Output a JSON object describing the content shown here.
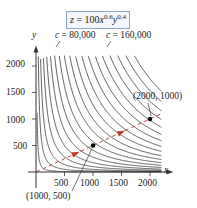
{
  "chart_data": {
    "type": "line",
    "formula": {
      "prefix": "z = 100",
      "x_exp": "0.6",
      "y_exp": "0.4"
    },
    "xlabel": "x",
    "ylabel": "y",
    "xlim": [
      0,
      2200
    ],
    "ylim": [
      0,
      2200
    ],
    "x_ticks": [
      "500",
      "1000",
      "1500",
      "2000"
    ],
    "y_ticks": [
      "500",
      "1000",
      "1500",
      "2000"
    ],
    "grid": false,
    "series": [
      {
        "name": "level curves",
        "description": "Level curves 100x^0.6 y^0.4 = c, c = 10,000 to 190,000 step 10,000",
        "c_values": [
          10000,
          20000,
          30000,
          40000,
          50000,
          60000,
          70000,
          80000,
          90000,
          100000,
          110000,
          120000,
          130000,
          140000,
          150000,
          160000,
          170000,
          180000,
          190000
        ]
      },
      {
        "name": "expansion path",
        "style": "dashed red",
        "points": [
          [
            0,
            0
          ],
          [
            2200,
            1100
          ]
        ]
      }
    ],
    "annotations": [
      {
        "text": "c = 80,000",
        "c": 80000
      },
      {
        "text": "c = 160,000",
        "c": 160000
      },
      {
        "text": "(1000, 500)",
        "x": 1000,
        "y": 500
      },
      {
        "text": "(2000, 1000)",
        "x": 2000,
        "y": 1000
      }
    ]
  },
  "labels": {
    "z_var": "z",
    "formula_mid": " = 100",
    "x_var": "x",
    "x_exp": "0.6",
    "y_var": "y",
    "y_exp": "0.4",
    "c80_var": "c",
    "c80_text": " = 80,000",
    "c160_var": "c",
    "c160_text": " = 160,000",
    "pt1": "(1000, 500)",
    "pt2": "(2000, 1000)",
    "x_axis": "x",
    "y_axis": "y",
    "xt500": "500",
    "xt1000": "1000",
    "xt1500": "1500",
    "xt2000": "2000",
    "yt500": "500",
    "yt1000": "1000",
    "yt1500": "1500",
    "yt2000": "2000"
  },
  "colors": {
    "curves": "#1a1a1a",
    "expansion_path": "#c0392b",
    "formula_border": "#8fa6c4"
  }
}
